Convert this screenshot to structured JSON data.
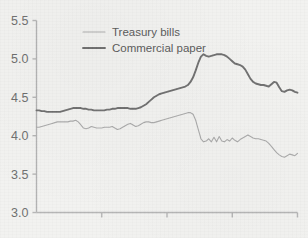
{
  "figure": {
    "name": "interest-rate-line-chart",
    "background_color": "#f2f2f0",
    "axis_color": "#b4b4b4"
  },
  "legend": {
    "position": "top-left-inside",
    "entries": [
      {
        "label": "Treasury bills",
        "color": "#a9a9a9",
        "width": 1.1
      },
      {
        "label": "Commercial paper",
        "color": "#6e6e6e",
        "width": 1.9
      }
    ]
  },
  "axes": {
    "y_ticks": [
      "5.5",
      "5.0",
      "4.5",
      "4.0",
      "3.5",
      "3.0"
    ],
    "x_ticks": [
      "",
      "",
      "",
      ""
    ]
  },
  "chart_data": {
    "type": "line",
    "title": "",
    "xlabel": "",
    "ylabel": "",
    "ylim": [
      3.0,
      5.5
    ],
    "xlim": [
      0,
      100
    ],
    "grid": false,
    "legend_position": "upper left",
    "y_tick_values": [
      3.0,
      3.5,
      4.0,
      4.5,
      5.0,
      5.5
    ],
    "x_tick_values": [
      25,
      50,
      75,
      100
    ],
    "x_tick_labels": [
      "",
      "",
      "",
      ""
    ],
    "x": [
      0,
      1,
      2,
      3,
      4,
      5,
      6,
      7,
      8,
      9,
      10,
      11,
      12,
      13,
      14,
      15,
      16,
      17,
      18,
      19,
      20,
      21,
      22,
      23,
      24,
      25,
      26,
      27,
      28,
      29,
      30,
      31,
      32,
      33,
      34,
      35,
      36,
      37,
      38,
      39,
      40,
      41,
      42,
      43,
      44,
      45,
      46,
      47,
      48,
      49,
      50,
      51,
      52,
      53,
      54,
      55,
      56,
      57,
      58,
      59,
      60,
      61,
      62,
      63,
      64,
      65,
      66,
      67,
      68,
      69,
      70,
      71,
      72,
      73,
      74,
      75,
      76,
      77,
      78,
      79,
      80,
      81,
      82,
      83,
      84,
      85,
      86,
      87,
      88,
      89,
      90,
      91,
      92,
      93,
      94,
      95,
      96,
      97,
      98,
      99,
      100
    ],
    "series": [
      {
        "name": "Commercial paper",
        "color": "#6e6e6e",
        "values": [
          4.33,
          4.33,
          4.32,
          4.32,
          4.31,
          4.31,
          4.31,
          4.31,
          4.31,
          4.31,
          4.32,
          4.33,
          4.34,
          4.35,
          4.36,
          4.36,
          4.36,
          4.36,
          4.35,
          4.35,
          4.34,
          4.34,
          4.33,
          4.33,
          4.33,
          4.33,
          4.33,
          4.34,
          4.34,
          4.35,
          4.35,
          4.36,
          4.36,
          4.36,
          4.36,
          4.36,
          4.35,
          4.35,
          4.35,
          4.36,
          4.37,
          4.39,
          4.41,
          4.44,
          4.47,
          4.5,
          4.52,
          4.54,
          4.55,
          4.56,
          4.57,
          4.58,
          4.59,
          4.6,
          4.61,
          4.62,
          4.63,
          4.64,
          4.66,
          4.7,
          4.76,
          4.85,
          4.95,
          5.03,
          5.06,
          5.04,
          5.03,
          5.04,
          5.05,
          5.06,
          5.06,
          5.06,
          5.05,
          5.03,
          5.0,
          4.97,
          4.94,
          4.93,
          4.92,
          4.9,
          4.86,
          4.8,
          4.74,
          4.7,
          4.68,
          4.67,
          4.66,
          4.66,
          4.65,
          4.64,
          4.67,
          4.7,
          4.69,
          4.63,
          4.58,
          4.57,
          4.59,
          4.6,
          4.59,
          4.57,
          4.56
        ]
      },
      {
        "name": "Treasury bills",
        "color": "#a9a9a9",
        "values": [
          4.11,
          4.11,
          4.12,
          4.13,
          4.14,
          4.15,
          4.16,
          4.17,
          4.18,
          4.18,
          4.18,
          4.18,
          4.18,
          4.19,
          4.19,
          4.2,
          4.18,
          4.14,
          4.1,
          4.09,
          4.1,
          4.12,
          4.11,
          4.1,
          4.1,
          4.1,
          4.11,
          4.11,
          4.11,
          4.12,
          4.1,
          4.08,
          4.09,
          4.11,
          4.13,
          4.15,
          4.16,
          4.14,
          4.12,
          4.13,
          4.15,
          4.17,
          4.18,
          4.18,
          4.17,
          4.17,
          4.18,
          4.19,
          4.2,
          4.21,
          4.22,
          4.23,
          4.24,
          4.25,
          4.26,
          4.27,
          4.28,
          4.29,
          4.3,
          4.3,
          4.28,
          4.2,
          4.08,
          3.96,
          3.92,
          3.93,
          3.96,
          3.92,
          3.98,
          3.92,
          3.99,
          3.93,
          3.92,
          3.95,
          3.93,
          3.97,
          3.94,
          3.92,
          3.95,
          3.97,
          3.99,
          4.01,
          3.99,
          3.97,
          3.96,
          3.96,
          3.95,
          3.94,
          3.93,
          3.9,
          3.86,
          3.82,
          3.78,
          3.75,
          3.73,
          3.72,
          3.74,
          3.76,
          3.75,
          3.74,
          3.77
        ]
      }
    ]
  }
}
